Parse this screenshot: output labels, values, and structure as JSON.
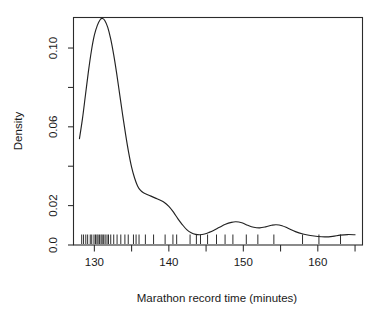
{
  "figure": {
    "type": "density-plot",
    "background_color": "#ffffff",
    "foreground_color": "#222222"
  },
  "chart_data": {
    "type": "line",
    "title": "",
    "subtitle": "",
    "xlabel": "Marathon record time (minutes)",
    "ylabel": "Density",
    "xlim": [
      127.2,
      166.0
    ],
    "ylim": [
      0.0,
      0.1155
    ],
    "grid": false,
    "legend": "none",
    "x_ticks_major": [
      130,
      140,
      150,
      160
    ],
    "x_tick_labels": [
      "130",
      "140",
      "150",
      "160"
    ],
    "x_ticks_minor": [
      135,
      145,
      155,
      165
    ],
    "y_ticks_major": [
      0.0,
      0.02,
      0.06,
      0.1
    ],
    "y_tick_labels": [
      "0.0",
      "0.02",
      "0.06",
      "0.10"
    ],
    "y_ticks_minor": [
      0.04,
      0.08
    ],
    "series": [
      {
        "name": "Kernel density estimate",
        "x": [
          128.0,
          128.4,
          128.8,
          129.2,
          129.6,
          130.0,
          130.4,
          130.8,
          131.1,
          131.4,
          131.8,
          132.2,
          132.6,
          133.0,
          133.4,
          133.8,
          134.2,
          134.6,
          135.0,
          135.4,
          135.8,
          136.2,
          136.6,
          137.0,
          137.6,
          138.2,
          138.8,
          139.4,
          140.0,
          140.6,
          141.2,
          141.8,
          142.4,
          143.0,
          143.6,
          144.2,
          144.8,
          145.4,
          146.0,
          146.8,
          147.6,
          148.4,
          149.0,
          149.8,
          150.6,
          151.4,
          152.2,
          153.0,
          153.8,
          154.4,
          155.2,
          156.0,
          157.0,
          158.0,
          159.0,
          160.0,
          161.0,
          162.0,
          163.0,
          164.0,
          165.0
        ],
        "y": [
          0.054,
          0.064,
          0.076,
          0.088,
          0.0985,
          0.1065,
          0.1115,
          0.1145,
          0.115,
          0.114,
          0.1105,
          0.1045,
          0.0965,
          0.087,
          0.0765,
          0.066,
          0.056,
          0.047,
          0.0395,
          0.034,
          0.03,
          0.0277,
          0.0265,
          0.0258,
          0.0248,
          0.0238,
          0.0228,
          0.0216,
          0.0196,
          0.0168,
          0.0134,
          0.0104,
          0.0078,
          0.0062,
          0.0054,
          0.0052,
          0.0056,
          0.0064,
          0.0074,
          0.009,
          0.0105,
          0.0115,
          0.0118,
          0.0113,
          0.01,
          0.009,
          0.0087,
          0.0092,
          0.01,
          0.0103,
          0.0098,
          0.0085,
          0.0068,
          0.0056,
          0.0048,
          0.0043,
          0.0041,
          0.0044,
          0.005,
          0.0053,
          0.0052
        ]
      }
    ],
    "rug": {
      "name": "Observed marathon record times",
      "count": 44,
      "values": [
        128.3,
        128.55,
        128.85,
        129.1,
        129.45,
        129.65,
        129.95,
        130.15,
        130.35,
        130.5,
        130.7,
        130.9,
        131.05,
        131.25,
        131.45,
        131.7,
        131.9,
        132.2,
        132.6,
        133.05,
        133.55,
        134.1,
        134.55,
        135.25,
        135.6,
        136.0,
        136.85,
        137.95,
        139.5,
        140.55,
        141.05,
        142.85,
        143.7,
        144.25,
        145.2,
        146.4,
        147.55,
        148.6,
        150.4,
        151.95,
        154.1,
        157.95,
        160.15,
        163.05
      ]
    }
  }
}
